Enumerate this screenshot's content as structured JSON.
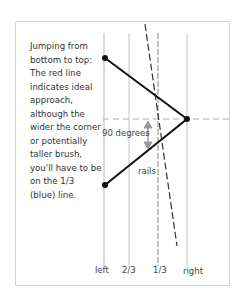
{
  "description": "Jumping from bottom to top: The red line indicates ideal approach, although the wider the corner or potentially taller brush, you'll have to be on the 1/3 (blue) line.",
  "labels": {
    "angle": "90 degrees",
    "rails": "rails"
  },
  "axis_labels": [
    "left",
    "2/3",
    "1/3",
    "right"
  ],
  "colors": {
    "approach_line": "#111111",
    "guide_lines": "#b0b0b0",
    "frame": "#d4d4d4",
    "arrow": "#9a9a9a"
  }
}
